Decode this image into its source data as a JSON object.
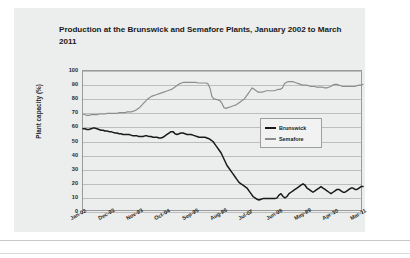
{
  "chart_data": {
    "type": "line",
    "title": "Production at the Brunswick and Semafore Plants, January 2002 to March 2011",
    "xlabel": "",
    "ylabel": "Plant capacity (%)",
    "ylim": [
      0,
      100
    ],
    "ytick_labels": [
      "0",
      "10",
      "20",
      "30",
      "40",
      "50",
      "60",
      "70",
      "80",
      "90",
      "100"
    ],
    "ytick_values": [
      0,
      10,
      20,
      30,
      40,
      50,
      60,
      70,
      80,
      90,
      100
    ],
    "xtick_labels": [
      "Jan-02",
      "Dec-02",
      "Nov-03",
      "Oct-04",
      "Sep-05",
      "Aug-06",
      "Jul-07",
      "Jun-08",
      "May-09",
      "Apr-10",
      "Mar-11"
    ],
    "grid": true,
    "legend_position": "center-right",
    "series": [
      {
        "name": "Brunswick",
        "color": "#1a1a1a",
        "values": [
          59,
          59,
          58.5,
          58.5,
          59,
          59.5,
          59.5,
          59,
          58.5,
          58,
          58,
          57.5,
          57.5,
          57,
          57,
          56.5,
          56,
          56,
          55.5,
          55.5,
          55,
          55,
          55,
          55,
          54.5,
          54,
          54,
          54,
          53.5,
          53.5,
          53.5,
          54,
          54,
          53.5,
          53.5,
          53,
          53,
          53,
          52.5,
          52.5,
          53,
          54,
          55,
          56,
          57,
          57,
          55.5,
          55,
          55.5,
          56,
          56,
          55.5,
          55,
          55,
          55,
          54.5,
          54,
          53.5,
          53,
          53,
          53,
          53,
          52.5,
          52,
          51,
          50,
          48,
          46,
          44,
          42,
          39,
          36,
          33,
          31,
          29,
          27,
          25,
          23,
          21,
          20,
          19,
          18,
          17,
          15,
          13,
          11,
          10,
          9,
          8.5,
          9,
          9.5,
          9.5,
          9.5,
          9.5,
          9.5,
          9.5,
          9.5,
          10,
          12,
          13,
          11,
          10,
          11,
          13,
          14,
          15,
          16,
          17,
          18,
          19,
          20,
          19,
          17,
          16,
          15,
          14,
          15,
          16,
          17,
          18,
          17,
          16,
          15,
          14,
          13,
          14,
          15,
          16,
          16,
          15,
          14,
          14,
          15,
          16,
          17,
          17,
          16,
          16,
          17,
          18,
          18
        ]
      },
      {
        "name": "Semafore",
        "color": "#8d8d8d",
        "values": [
          69.5,
          69,
          68.5,
          68.5,
          69,
          69,
          69,
          69,
          69.5,
          69.5,
          69.5,
          69.5,
          70,
          70,
          70,
          70,
          70,
          70,
          70.5,
          70.5,
          70.5,
          70.5,
          71,
          71,
          71,
          71.5,
          72,
          73,
          74,
          75.5,
          77,
          78.5,
          80,
          81,
          82,
          82.5,
          83,
          83.5,
          84,
          84.5,
          85,
          85.5,
          86,
          86.5,
          87,
          88,
          89,
          90,
          91,
          91.5,
          92,
          92,
          92,
          92,
          92,
          92,
          92,
          91.5,
          91.5,
          91.5,
          91.5,
          91.5,
          91,
          88,
          82,
          80,
          80,
          79.5,
          79,
          77,
          74,
          73.5,
          74,
          74.5,
          75,
          75.5,
          76,
          77,
          78,
          79,
          80,
          82,
          84,
          86,
          88,
          87,
          86,
          85,
          85,
          85,
          85.5,
          86,
          86,
          86,
          86,
          86,
          86.5,
          87,
          87,
          88,
          91,
          92,
          92.5,
          92.5,
          92.5,
          92,
          91.5,
          91,
          90.5,
          90,
          90,
          90,
          89.5,
          89,
          89,
          89,
          88.5,
          88.5,
          88.5,
          88.5,
          88,
          88,
          88.5,
          89,
          90,
          90.5,
          90.5,
          90,
          89.5,
          89,
          89,
          89,
          89,
          89,
          89,
          89,
          89.5,
          90,
          90,
          90.5
        ]
      }
    ]
  }
}
